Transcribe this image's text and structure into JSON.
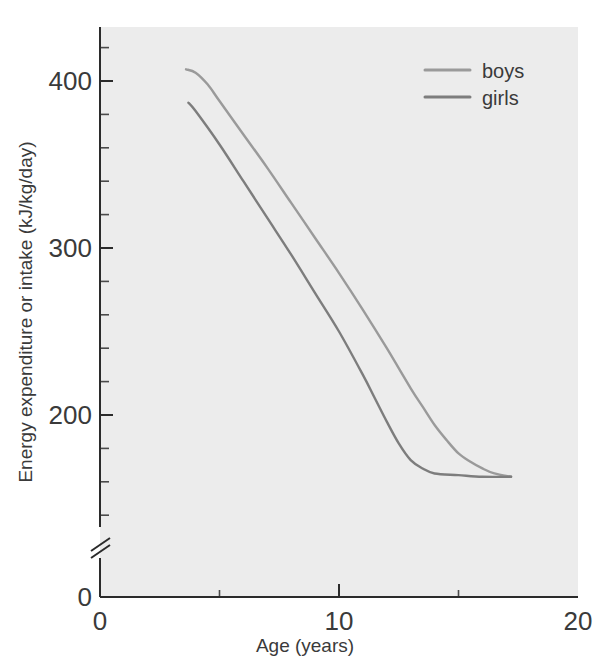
{
  "chart_data": {
    "type": "line",
    "title": "",
    "xlabel": "Age (years)",
    "ylabel": "Energy expenditure or intake (kJ/kg/day)",
    "xlim": [
      0,
      20
    ],
    "ylim": [
      0,
      440
    ],
    "grid": false,
    "legend_position": "top-right",
    "axis_break_y": true,
    "x_ticks": [
      "0",
      "10",
      "20"
    ],
    "x_tick_values": [
      0,
      10,
      20
    ],
    "x_minor_tick_values": [
      5,
      15
    ],
    "y_ticks": [
      "0",
      "200",
      "300",
      "400"
    ],
    "y_tick_values": [
      0,
      200,
      300,
      400
    ],
    "y_minor_tick_values": [
      140,
      160,
      180,
      220,
      240,
      260,
      280,
      320,
      340,
      360,
      380,
      420
    ],
    "series": [
      {
        "name": "boys",
        "color": "#9a9a9a",
        "x": [
          3.6,
          4.0,
          4.5,
          5.0,
          6.0,
          7.0,
          8.0,
          9.0,
          10.0,
          11.0,
          12.0,
          13.0,
          13.5,
          14.0,
          14.5,
          15.0,
          15.5,
          16.0,
          16.5,
          17.2
        ],
        "y": [
          407,
          405,
          398,
          388,
          368,
          348,
          327,
          306,
          285,
          263,
          240,
          216,
          205,
          194,
          185,
          177,
          172,
          168,
          165,
          163
        ]
      },
      {
        "name": "girls",
        "color": "#7d7d7d",
        "x": [
          3.7,
          4.0,
          5.0,
          6.0,
          7.0,
          8.0,
          9.0,
          10.0,
          11.0,
          11.5,
          12.0,
          12.5,
          13.0,
          13.5,
          14.0,
          15.0,
          16.0,
          17.2
        ],
        "y": [
          387,
          382,
          362,
          340,
          318,
          296,
          273,
          250,
          224,
          210,
          196,
          183,
          173,
          168,
          165,
          164,
          163,
          163
        ]
      }
    ]
  },
  "legend": {
    "items": [
      {
        "label": "boys",
        "color": "#9a9a9a"
      },
      {
        "label": "girls",
        "color": "#7d7d7d"
      }
    ]
  },
  "axes": {
    "x_title": "Age (years)",
    "y_title": "Energy expenditure or intake (kJ/kg/day)",
    "x_tick_labels": [
      "0",
      "10",
      "20"
    ],
    "y_tick_labels": [
      "400",
      "300",
      "200",
      "0"
    ]
  },
  "colors": {
    "plot_background": "#ececec",
    "page_background": "#ffffff",
    "axis": "#2b2b2b",
    "text": "#3a3a3a"
  }
}
